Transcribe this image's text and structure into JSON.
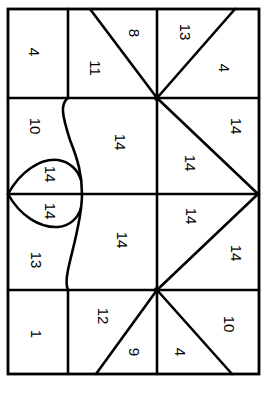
{
  "diagram": {
    "line_color": "#000000",
    "background": "#ffffff",
    "regions": [
      {
        "id": "r1",
        "label": "4"
      },
      {
        "id": "r2",
        "label": "11"
      },
      {
        "id": "r3",
        "label": "8"
      },
      {
        "id": "r4",
        "label": "13"
      },
      {
        "id": "r5",
        "label": "4"
      },
      {
        "id": "r6",
        "label": "10"
      },
      {
        "id": "r7",
        "label": "14"
      },
      {
        "id": "r8",
        "label": "14"
      },
      {
        "id": "r9",
        "label": "14"
      },
      {
        "id": "r10",
        "label": "14"
      },
      {
        "id": "r11",
        "label": "14"
      },
      {
        "id": "r12",
        "label": "13"
      },
      {
        "id": "r13",
        "label": "14"
      },
      {
        "id": "r14",
        "label": "14"
      },
      {
        "id": "r15",
        "label": "14"
      },
      {
        "id": "r16",
        "label": "1"
      },
      {
        "id": "r17",
        "label": "12"
      },
      {
        "id": "r18",
        "label": "9"
      },
      {
        "id": "r19",
        "label": "4"
      },
      {
        "id": "r20",
        "label": "10"
      }
    ]
  }
}
